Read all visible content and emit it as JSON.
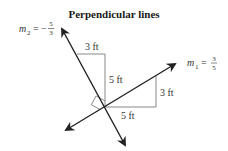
{
  "title": "Perpendicular lines",
  "line1": {
    "label_var": "m",
    "label_sub": "1",
    "label_eq": "=",
    "slope_sign": "",
    "slope_num": "3",
    "slope_den": "5",
    "color": "#222222"
  },
  "line2": {
    "label_var": "m",
    "label_sub": "2",
    "label_eq": "=",
    "slope_sign": "−",
    "slope_num": "5",
    "slope_den": "3",
    "color": "#222222"
  },
  "triangle1": {
    "run_label": "3 ft",
    "rise_label": "5 ft"
  },
  "triangle2": {
    "run_label": "5 ft",
    "rise_label": "3 ft"
  },
  "guide_color": "#888888"
}
